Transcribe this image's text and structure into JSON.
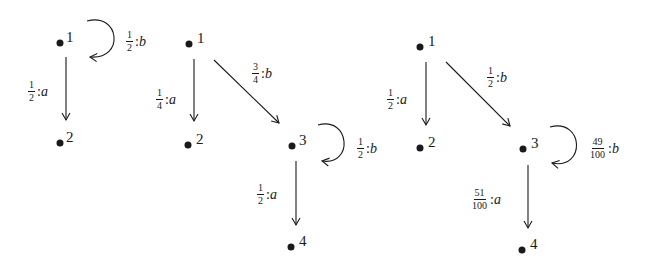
{
  "figure": {
    "automata": [
      {
        "id": "left",
        "nodes": [
          {
            "label": "1",
            "x": 60,
            "y": 43
          },
          {
            "label": "2",
            "x": 60,
            "y": 143
          }
        ],
        "edges": [
          {
            "from": "1",
            "to": "1",
            "kind": "self-loop",
            "prob_num": "1",
            "prob_den": "2",
            "symbol": "b"
          },
          {
            "from": "1",
            "to": "2",
            "kind": "straight",
            "prob_num": "1",
            "prob_den": "2",
            "symbol": "a"
          }
        ]
      },
      {
        "id": "middle",
        "nodes": [
          {
            "label": "1",
            "x": 189,
            "y": 44
          },
          {
            "label": "2",
            "x": 188,
            "y": 145
          },
          {
            "label": "3",
            "x": 292,
            "y": 146
          },
          {
            "label": "4",
            "x": 291,
            "y": 247
          }
        ],
        "edges": [
          {
            "from": "1",
            "to": "2",
            "kind": "straight",
            "prob_num": "1",
            "prob_den": "4",
            "symbol": "a"
          },
          {
            "from": "1",
            "to": "3",
            "kind": "straight",
            "prob_num": "3",
            "prob_den": "4",
            "symbol": "b"
          },
          {
            "from": "3",
            "to": "3",
            "kind": "self-loop",
            "prob_num": "1",
            "prob_den": "2",
            "symbol": "b"
          },
          {
            "from": "3",
            "to": "4",
            "kind": "straight",
            "prob_num": "1",
            "prob_den": "2",
            "symbol": "a"
          }
        ]
      },
      {
        "id": "right",
        "nodes": [
          {
            "label": "1",
            "x": 420,
            "y": 47
          },
          {
            "label": "2",
            "x": 420,
            "y": 148
          },
          {
            "label": "3",
            "x": 523,
            "y": 149
          },
          {
            "label": "4",
            "x": 522,
            "y": 250
          }
        ],
        "edges": [
          {
            "from": "1",
            "to": "2",
            "kind": "straight",
            "prob_num": "1",
            "prob_den": "2",
            "symbol": "a"
          },
          {
            "from": "1",
            "to": "3",
            "kind": "straight",
            "prob_num": "1",
            "prob_den": "2",
            "symbol": "b"
          },
          {
            "from": "3",
            "to": "3",
            "kind": "self-loop",
            "prob_num": "49",
            "prob_den": "100",
            "symbol": "b"
          },
          {
            "from": "3",
            "to": "4",
            "kind": "straight",
            "prob_num": "51",
            "prob_den": "100",
            "symbol": "a"
          }
        ]
      }
    ]
  },
  "colors": {
    "ink": "#1a1a1a",
    "background": "#ffffff"
  }
}
